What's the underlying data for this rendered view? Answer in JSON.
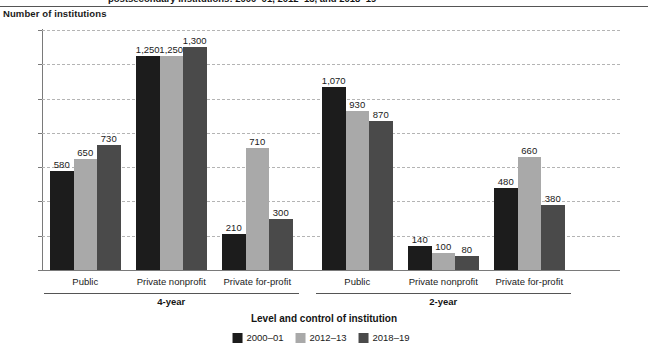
{
  "figure": {
    "title_partial": "postsecondary institutions: 2000–01, 2012–13, and 2018–19",
    "y_caption": "Number of institutions",
    "x_axis_title": "Level and control of institution"
  },
  "chart_data": {
    "type": "bar",
    "title": "Number of institutions",
    "xlabel": "Level and control of institution",
    "ylabel": "Number of institutions",
    "ylim": [
      0,
      1400
    ],
    "ytick_labels": [
      "0",
      "200",
      "400",
      "600",
      "800",
      "1,000",
      "1,200",
      "1,400"
    ],
    "ytick_values": [
      0,
      200,
      400,
      600,
      800,
      1000,
      1200,
      1400
    ],
    "grid": true,
    "legend_position": "bottom",
    "categories": [
      "Public",
      "Private nonprofit",
      "Private for-profit",
      "Public",
      "Private nonprofit",
      "Private for-profit"
    ],
    "supergroups": [
      {
        "label": "4-year",
        "categories": [
          "Public",
          "Private nonprofit",
          "Private for-profit"
        ]
      },
      {
        "label": "2-year",
        "categories": [
          "Public",
          "Private nonprofit",
          "Private for-profit"
        ]
      }
    ],
    "series": [
      {
        "name": "2000–01",
        "color": "#1c1c1c",
        "values": [
          580,
          1250,
          210,
          1070,
          140,
          480
        ],
        "labels": [
          "580",
          "1,250",
          "210",
          "1,070",
          "140",
          "480"
        ]
      },
      {
        "name": "2012–13",
        "color": "#a9a9a9",
        "values": [
          650,
          1250,
          710,
          930,
          100,
          660
        ],
        "labels": [
          "650",
          "1,250",
          "710",
          "930",
          "100",
          "660"
        ]
      },
      {
        "name": "2018–19",
        "color": "#4a4a4a",
        "values": [
          730,
          1300,
          300,
          870,
          80,
          380
        ],
        "labels": [
          "730",
          "1,300",
          "300",
          "870",
          "80",
          "380"
        ]
      }
    ]
  }
}
